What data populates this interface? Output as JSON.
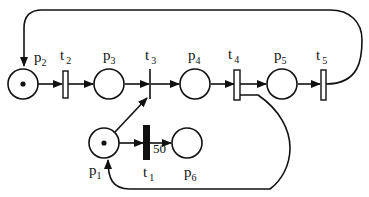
{
  "diagram": {
    "type": "petri-net",
    "places": [
      {
        "id": "p1",
        "name": "p",
        "sub": "1",
        "tokens": 1
      },
      {
        "id": "p2",
        "name": "p",
        "sub": "2",
        "tokens": 1
      },
      {
        "id": "p3",
        "name": "p",
        "sub": "3",
        "tokens": 0
      },
      {
        "id": "p4",
        "name": "p",
        "sub": "4",
        "tokens": 0
      },
      {
        "id": "p5",
        "name": "p",
        "sub": "5",
        "tokens": 0
      },
      {
        "id": "p6",
        "name": "p",
        "sub": "6",
        "tokens": 0
      }
    ],
    "transitions": [
      {
        "id": "t1",
        "name": "t",
        "sub": "1",
        "style": "filled-bar"
      },
      {
        "id": "t2",
        "name": "t",
        "sub": "2",
        "style": "hollow-bar"
      },
      {
        "id": "t3",
        "name": "t",
        "sub": "3",
        "style": "thin-line"
      },
      {
        "id": "t4",
        "name": "t",
        "sub": "4",
        "style": "hollow-bar"
      },
      {
        "id": "t5",
        "name": "t",
        "sub": "5",
        "style": "hollow-bar"
      }
    ],
    "arcs": [
      {
        "from": "p2",
        "to": "t2"
      },
      {
        "from": "t2",
        "to": "p3"
      },
      {
        "from": "p3",
        "to": "t3"
      },
      {
        "from": "p1",
        "to": "t3"
      },
      {
        "from": "t3",
        "to": "p4"
      },
      {
        "from": "p4",
        "to": "t4"
      },
      {
        "from": "t4",
        "to": "p5"
      },
      {
        "from": "t4",
        "to": "p1"
      },
      {
        "from": "p5",
        "to": "t5"
      },
      {
        "from": "t5",
        "to": "p2"
      },
      {
        "from": "p1",
        "to": "t1"
      },
      {
        "from": "t1",
        "to": "p6",
        "weight": "50"
      }
    ],
    "weight_label": "50",
    "colors": {
      "stroke": "#111111",
      "background": "#ffffff"
    }
  }
}
